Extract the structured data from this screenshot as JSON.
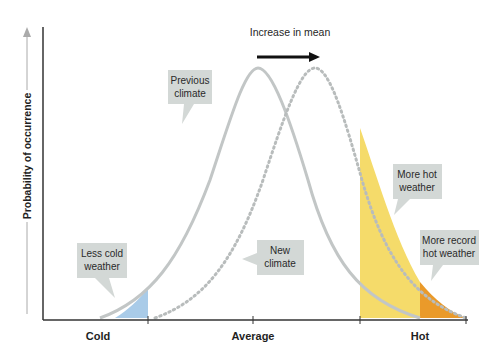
{
  "title_arrow_label": "Increase in mean",
  "y_axis": {
    "label": "Probability of occurrence"
  },
  "x_axis": {
    "ticks": [
      "Cold",
      "Average",
      "Hot"
    ]
  },
  "callouts": {
    "previous_line1": "Previous",
    "previous_line2": "climate",
    "new_line1": "New",
    "new_line2": "climate",
    "less_cold_line1": "Less cold",
    "less_cold_line2": "weather",
    "more_hot_line1": "More hot",
    "more_hot_line2": "weather",
    "record_hot_line1": "More record",
    "record_hot_line2": "hot weather"
  },
  "colors": {
    "previous_curve": "#c2c6c6",
    "new_curve": "#b8bcbc",
    "cold_fill": "#a9cbe8",
    "hot_fill": "#f5db6a",
    "record_hot_fill": "#ea9a2a",
    "callout_bg": "#d3d8d6",
    "axis": "#333333"
  }
}
